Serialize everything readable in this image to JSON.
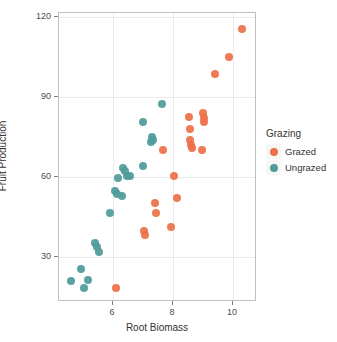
{
  "chart_data": {
    "type": "scatter",
    "title": "",
    "xlabel": "Root Biomass",
    "ylabel": "Fruit Production",
    "xlim": [
      4.2,
      10.8
    ],
    "ylim": [
      13.0,
      121.5
    ],
    "xticks": [
      6,
      8,
      10
    ],
    "xtick_labels": [
      "6",
      "8",
      "10"
    ],
    "yticks": [
      30,
      60,
      90,
      120
    ],
    "ytick_labels": [
      "30",
      "60",
      "90",
      "120"
    ],
    "grid": true,
    "legend": {
      "title": "Grazing",
      "position": "right",
      "entries": [
        {
          "label": "Grazed",
          "color": "#ED7048"
        },
        {
          "label": "Ungrazed",
          "color": "#4F9A9A"
        }
      ]
    },
    "series": [
      {
        "name": "Ungrazed",
        "color": "#4F9A9A",
        "points": [
          [
            4.6,
            21.0
          ],
          [
            4.93,
            25.5
          ],
          [
            5.04,
            18.2
          ],
          [
            5.18,
            21.3
          ],
          [
            5.41,
            35.0
          ],
          [
            5.48,
            33.5
          ],
          [
            5.53,
            31.8
          ],
          [
            5.9,
            46.5
          ],
          [
            6.07,
            54.8
          ],
          [
            6.12,
            53.5
          ],
          [
            6.18,
            59.7
          ],
          [
            6.3,
            52.8
          ],
          [
            6.33,
            63.3
          ],
          [
            6.4,
            62.2
          ],
          [
            6.48,
            60.4
          ],
          [
            6.55,
            60.3
          ],
          [
            7.0,
            80.5
          ],
          [
            7.01,
            64.0
          ],
          [
            7.25,
            73.0
          ],
          [
            7.3,
            75.0
          ],
          [
            7.32,
            74.0
          ],
          [
            7.63,
            87.5
          ]
        ]
      },
      {
        "name": "Grazed",
        "color": "#ED7048",
        "points": [
          [
            6.1,
            18.2
          ],
          [
            7.02,
            39.5
          ],
          [
            7.06,
            38.2
          ],
          [
            7.39,
            50.0
          ],
          [
            7.42,
            46.5
          ],
          [
            7.65,
            70.0
          ],
          [
            7.92,
            41.2
          ],
          [
            8.03,
            60.3
          ],
          [
            8.14,
            52.0
          ],
          [
            8.53,
            82.3
          ],
          [
            8.56,
            78.0
          ],
          [
            8.57,
            74.0
          ],
          [
            8.6,
            72.0
          ],
          [
            8.62,
            70.8
          ],
          [
            8.95,
            70.0
          ],
          [
            9.0,
            84.0
          ],
          [
            9.02,
            82.0
          ],
          [
            9.04,
            80.5
          ],
          [
            9.4,
            98.5
          ],
          [
            9.88,
            105.0
          ],
          [
            10.3,
            115.5
          ]
        ]
      }
    ]
  }
}
